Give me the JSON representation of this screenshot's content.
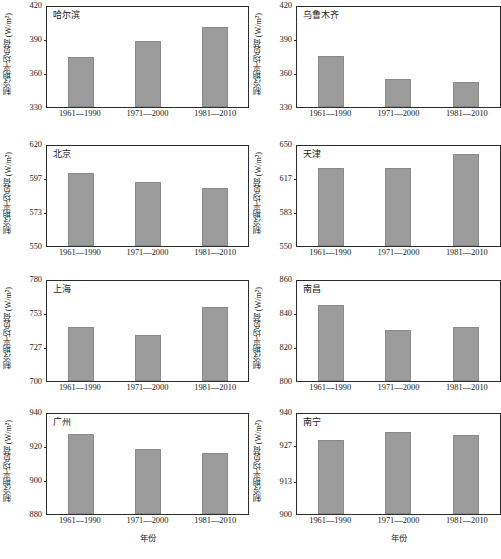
{
  "figure": {
    "ylabel": "制冷期平均负荷 (W/m²)",
    "xlabel": "年份",
    "bar_color": "#9b9b9b",
    "axis_color": "#2b2b2b",
    "caption": ""
  },
  "chart_data": [
    {
      "type": "bar",
      "title": "哈尔滨",
      "categories": [
        "1961—1990",
        "1971—2000",
        "1981—2010"
      ],
      "values": [
        374,
        388,
        401
      ],
      "ylabel": "制冷期平均负荷 (W/m²)",
      "xlabel": "",
      "ylim": [
        330,
        420
      ],
      "yticks": [
        330,
        360,
        390,
        420
      ],
      "grid": false
    },
    {
      "type": "bar",
      "title": "乌鲁木齐",
      "categories": [
        "1961—1990",
        "1971—2000",
        "1981—2010"
      ],
      "values": [
        375,
        355,
        352
      ],
      "ylabel": "制冷期平均负荷 (W/m²)",
      "xlabel": "",
      "ylim": [
        330,
        420
      ],
      "yticks": [
        330,
        360,
        390,
        420
      ],
      "grid": false
    },
    {
      "type": "bar",
      "title": "北京",
      "categories": [
        "1961—1990",
        "1971—2000",
        "1981—2010"
      ],
      "values": [
        600,
        594,
        590
      ],
      "ylabel": "制冷期平均负荷 (W/m²)",
      "xlabel": "",
      "ylim": [
        550,
        620
      ],
      "yticks": [
        550,
        573,
        597,
        620
      ],
      "grid": false
    },
    {
      "type": "bar",
      "title": "天津",
      "categories": [
        "1961—1990",
        "1971—2000",
        "1981—2010"
      ],
      "values": [
        626,
        626,
        640
      ],
      "ylabel": "制冷期平均负荷 (W/m²)",
      "xlabel": "",
      "ylim": [
        550,
        650
      ],
      "yticks": [
        550,
        583,
        617,
        650
      ],
      "grid": false
    },
    {
      "type": "bar",
      "title": "上海",
      "categories": [
        "1961—1990",
        "1971—2000",
        "1981—2010"
      ],
      "values": [
        742,
        736,
        758
      ],
      "ylabel": "制冷期平均负荷 (W/m²)",
      "xlabel": "",
      "ylim": [
        700,
        780
      ],
      "yticks": [
        700,
        727,
        753,
        780
      ],
      "grid": false
    },
    {
      "type": "bar",
      "title": "南昌",
      "categories": [
        "1961—1990",
        "1971—2000",
        "1981—2010"
      ],
      "values": [
        845,
        830,
        832
      ],
      "ylabel": "制冷期平均负荷 (W/m²)",
      "xlabel": "",
      "ylim": [
        800,
        860
      ],
      "yticks": [
        800,
        820,
        840,
        860
      ],
      "grid": false
    },
    {
      "type": "bar",
      "title": "广州",
      "categories": [
        "1961—1990",
        "1971—2000",
        "1981—2010"
      ],
      "values": [
        927,
        918,
        916
      ],
      "ylabel": "制冷期平均负荷 (W/m²)",
      "xlabel": "年份",
      "ylim": [
        880,
        940
      ],
      "yticks": [
        880,
        900,
        920,
        940
      ],
      "grid": false
    },
    {
      "type": "bar",
      "title": "南宁",
      "categories": [
        "1961—1990",
        "1971—2000",
        "1981—2010"
      ],
      "values": [
        929,
        932,
        931
      ],
      "ylabel": "制冷期平均负荷 (W/m²)",
      "xlabel": "年份",
      "ylim": [
        900,
        940
      ],
      "yticks": [
        900,
        913,
        927,
        940
      ],
      "grid": false
    }
  ]
}
